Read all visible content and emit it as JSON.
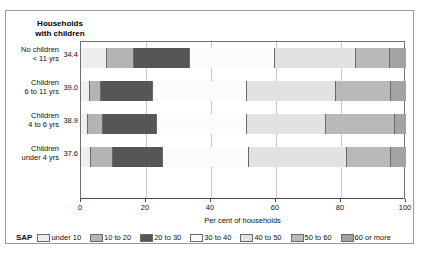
{
  "panel": {
    "title_line1": "Households",
    "title_line2": "with children"
  },
  "chart_data": {
    "type": "bar",
    "orientation": "horizontal",
    "stacked": true,
    "title": "Households with children",
    "xlabel": "Per cent of households",
    "ylabel": "",
    "xlim": [
      0,
      100
    ],
    "xticks": [
      "0",
      "20",
      "40",
      "60",
      "80",
      "100"
    ],
    "grid": true,
    "legend_position": "bottom",
    "legend_title": "SAP",
    "categories": [
      "No children < 11 yrs",
      "Children 6 to 11 yrs",
      "Children 4 to 6 yrs",
      "Children under 4 yrs"
    ],
    "category_values": [
      "34.4",
      "39.0",
      "38.9",
      "37.6"
    ],
    "series": [
      {
        "name": "under 10",
        "color": "#eeeeee",
        "values": [
          8.0,
          2.8,
          2.0,
          3.1
        ]
      },
      {
        "name": "10 to 20",
        "color": "#b4b4b4",
        "values": [
          8.3,
          3.4,
          4.8,
          6.8
        ]
      },
      {
        "name": "20 to 30",
        "color": "#565656",
        "values": [
          17.1,
          16.0,
          16.6,
          15.4
        ]
      },
      {
        "name": "30 to 40",
        "color": "#fcfcfc",
        "values": [
          26.2,
          28.8,
          27.6,
          26.5
        ]
      },
      {
        "name": "40 to 50",
        "color": "#e2e2e2",
        "values": [
          25.0,
          27.4,
          24.3,
          30.2
        ]
      },
      {
        "name": "50 to 60",
        "color": "#b9b9b9",
        "values": [
          10.4,
          17.0,
          21.3,
          13.4
        ]
      },
      {
        "name": "60 or more",
        "color": "#a3a3a3",
        "values": [
          5.0,
          4.6,
          3.4,
          4.6
        ]
      }
    ]
  },
  "rows": [
    {
      "label_line1": "No children",
      "label_line2": "< 11 yrs",
      "value": "34.4"
    },
    {
      "label_line1": "Children",
      "label_line2": "6 to 11 yrs",
      "value": "39.0"
    },
    {
      "label_line1": "Children",
      "label_line2": "4 to 6 yrs",
      "value": "38.9"
    },
    {
      "label_line1": "Children",
      "label_line2": "under 4 yrs",
      "value": "37.6"
    }
  ],
  "xaxis": {
    "title": "Per cent of households",
    "ticks": [
      "0",
      "20",
      "40",
      "60",
      "80",
      "100"
    ]
  },
  "legend": {
    "title": "SAP",
    "items": [
      {
        "label": "under 10",
        "color": "#eeeeee"
      },
      {
        "label": "10 to 20",
        "color": "#b4b4b4"
      },
      {
        "label": "20 to 30",
        "color": "#565656"
      },
      {
        "label": "30 to 40",
        "color": "#fcfcfc"
      },
      {
        "label": "40 to 50",
        "color": "#e2e2e2"
      },
      {
        "label": "50 to 60",
        "color": "#b9b9b9"
      },
      {
        "label": "60 or more",
        "color": "#a3a3a3"
      }
    ]
  }
}
